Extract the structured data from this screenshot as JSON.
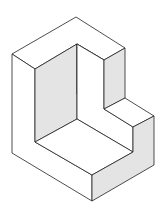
{
  "diagram": {
    "type": "isometric-solid",
    "colors": {
      "background": "#ffffff",
      "stroke": "#222222",
      "shaded_face": "#e4e4e4",
      "light_face": "#ffffff"
    }
  }
}
